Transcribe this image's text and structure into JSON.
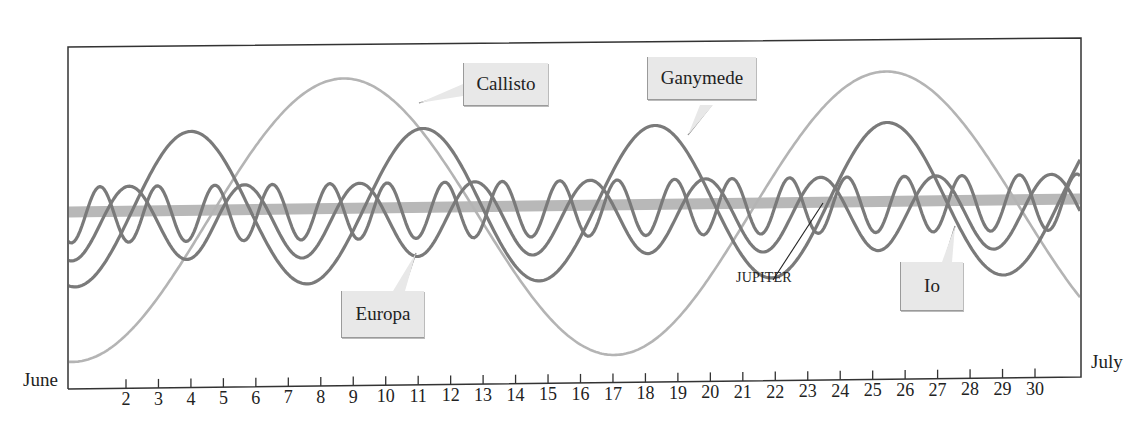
{
  "chart_data": {
    "type": "line",
    "title": "",
    "xlabel": "",
    "ylabel": "",
    "x_start_label": "June",
    "x_end_label": "July",
    "x_ticks": [
      2,
      3,
      4,
      5,
      6,
      7,
      8,
      9,
      10,
      11,
      12,
      13,
      14,
      15,
      16,
      17,
      18,
      19,
      20,
      21,
      22,
      23,
      24,
      25,
      26,
      27,
      28,
      29,
      30
    ],
    "xlim": [
      0.2,
      31.4
    ],
    "grid": false,
    "legend": "inline labels",
    "series": [
      {
        "name": "Callisto",
        "period_days": 16.7,
        "amplitude": 140,
        "center_offset": 10,
        "peak_days": [
          8.7,
          25.5
        ],
        "trough_days": [
          0.9,
          17.4
        ],
        "color": "#b4b4b4"
      },
      {
        "name": "Ganymede",
        "period_days": 7.15,
        "amplitude": 77,
        "center_offset": -2,
        "peak_days": [
          4.0,
          11.3,
          18.4,
          25.6
        ],
        "color": "#7a7a7a"
      },
      {
        "name": "Europa",
        "period_days": 3.55,
        "amplitude": 37,
        "center_offset": 12,
        "peak_days": [
          2.1,
          5.6,
          9.2,
          12.7,
          16.3,
          19.8,
          23.4,
          26.9,
          30.5
        ],
        "color": "#7a7a7a"
      },
      {
        "name": "Io",
        "period_days": 1.77,
        "amplitude": 28,
        "center_offset": 3,
        "peak_days": [
          1.2,
          3.0,
          4.8,
          6.5,
          8.3,
          10.1,
          11.8,
          13.6,
          15.4,
          17.1,
          18.9,
          20.7,
          22.5,
          24.2,
          26.0,
          27.8,
          29.5
        ],
        "color": "#7a7a7a"
      },
      {
        "name": "JUPITER",
        "type": "band",
        "color": "#b8b8b8"
      }
    ]
  },
  "labels": {
    "june": "June",
    "july": "July",
    "callisto": "Callisto",
    "ganymede": "Ganymede",
    "europa": "Europa",
    "io": "Io",
    "jupiter": "JUPITER"
  },
  "colors": {
    "frame": "#333333",
    "moon_dark": "#7a7a7a",
    "callisto": "#b4b4b4",
    "jupiter_band": "#b8b8b8",
    "label_box": "#e8e8e8"
  }
}
